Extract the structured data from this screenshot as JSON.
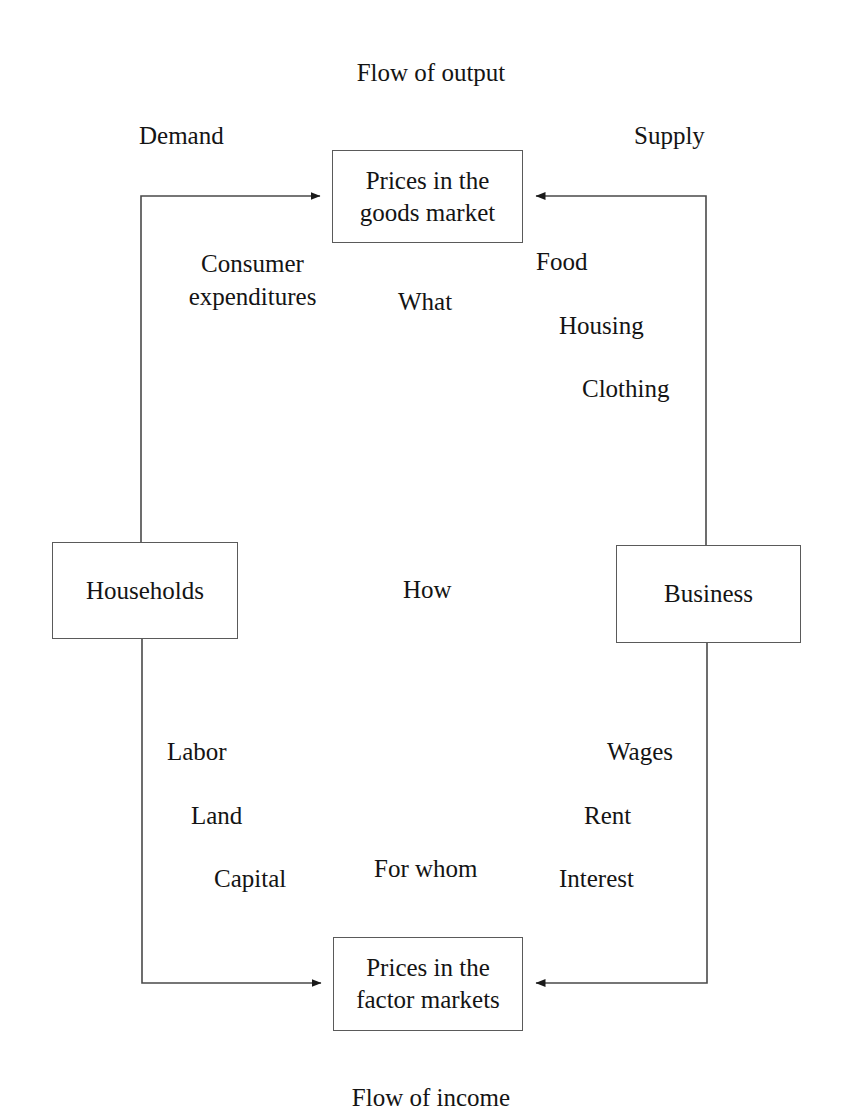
{
  "diagram": {
    "title_top": "Flow of output",
    "title_bottom": "Flow of income",
    "side_labels": {
      "left": "Demand",
      "right": "Supply"
    },
    "boxes": {
      "goods_market": "Prices in the\ngoods market",
      "factor_markets": "Prices in the\nfactor markets",
      "households": "Households",
      "business": "Business"
    },
    "center_questions": {
      "upper": "What",
      "middle": "How",
      "lower": "For whom"
    },
    "upper_left_flow": "Consumer\nexpenditures",
    "upper_right_flow": [
      "Food",
      "Housing",
      "Clothing"
    ],
    "lower_left_flow": [
      "Labor",
      "Land",
      "Capital"
    ],
    "lower_right_flow": [
      "Wages",
      "Rent",
      "Interest"
    ],
    "colors": {
      "ink": "#141414",
      "line": "#4a4a4a",
      "box_border": "#5a5a5a",
      "background": "#ffffff"
    }
  }
}
